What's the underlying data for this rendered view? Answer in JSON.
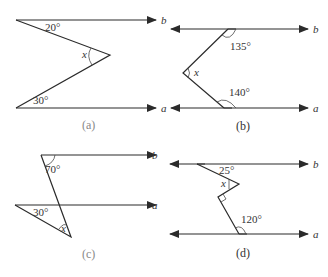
{
  "figures": [
    {
      "id": "a",
      "caption": "(a)",
      "lines": {
        "top": "b",
        "bottom": "a"
      },
      "angles": {
        "top": "20°",
        "vertex": "x",
        "bottom": "30°"
      }
    },
    {
      "id": "b",
      "caption": "(b)",
      "lines": {
        "top": "b",
        "bottom": "a"
      },
      "angles": {
        "top": "135°",
        "vertex": "x",
        "bottom": "140°"
      }
    },
    {
      "id": "c",
      "caption": "(c)",
      "lines": {
        "top": "b",
        "bottom": "a"
      },
      "angles": {
        "top": "70°",
        "left": "30°",
        "vertex": "x"
      }
    },
    {
      "id": "d",
      "caption": "(d)",
      "lines": {
        "top": "b",
        "bottom": "a"
      },
      "angles": {
        "top": "25°",
        "vertex": "x",
        "right_angle": "90°",
        "bottom": "120°"
      }
    }
  ],
  "colors": {
    "line": "#2b2b2b",
    "caption_gray": "#888888"
  }
}
